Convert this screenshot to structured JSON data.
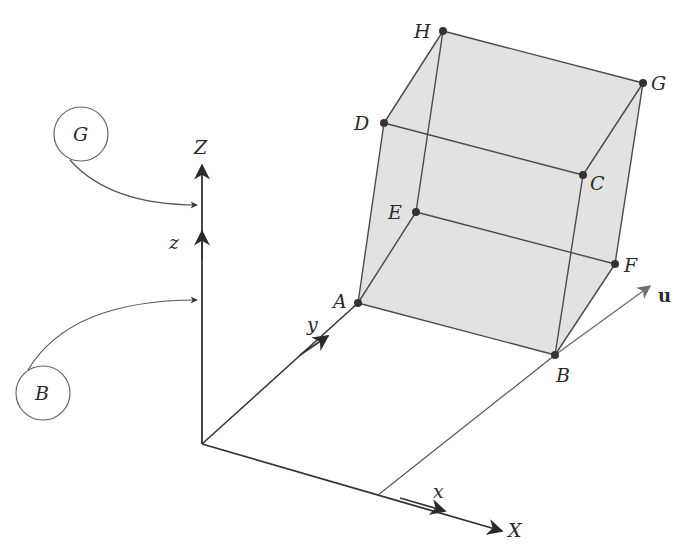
{
  "diagram": {
    "type": "3d-cube-coordinate-frames",
    "points": {
      "A": {
        "label": "A",
        "x": 358,
        "y": 303
      },
      "B": {
        "label": "B",
        "x": 555,
        "y": 355
      },
      "C": {
        "label": "C",
        "x": 583,
        "y": 175
      },
      "D": {
        "label": "D",
        "x": 384,
        "y": 123
      },
      "E": {
        "label": "E",
        "x": 416,
        "y": 212
      },
      "F": {
        "label": "F",
        "x": 615,
        "y": 264
      },
      "G": {
        "label": "G",
        "x": 643,
        "y": 83
      },
      "H": {
        "label": "H",
        "x": 443,
        "y": 31
      }
    },
    "axes": {
      "X": "X",
      "Z": "Z",
      "x": "x",
      "y": "y",
      "z": "z",
      "u": "u"
    },
    "callouts": {
      "G": "G",
      "B": "B"
    },
    "colors": {
      "fill": "#e2e2e2",
      "edge": "#4a4a4a",
      "axis": "#333333",
      "u_arrow": "#707070"
    }
  }
}
